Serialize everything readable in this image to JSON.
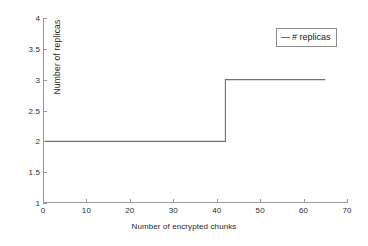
{
  "chart_data": {
    "type": "line",
    "title": "",
    "subtitle": "",
    "xlabel": "Number of encrypted chunks",
    "ylabel": "Number of replicas",
    "xlim": [
      0,
      70
    ],
    "ylim": [
      1,
      4
    ],
    "xticks": [
      0,
      10,
      20,
      30,
      40,
      50,
      60,
      70
    ],
    "xticklabels": [
      "0",
      "10",
      "20",
      "30",
      "40",
      "50",
      "60",
      "70"
    ],
    "yticks": [
      1,
      1.5,
      2,
      2.5,
      3,
      3.5,
      4
    ],
    "yticklabels": [
      "1",
      "1.5",
      "2",
      "2.5",
      "3",
      "3.5",
      "4"
    ],
    "grid": false,
    "legend_position": "top-right",
    "series": [
      {
        "name": "# replicas",
        "color": "#6f6f6f",
        "style": "step",
        "x": [
          0.5,
          42,
          42,
          65
        ],
        "values": [
          2,
          2,
          3,
          3
        ],
        "points": [
          {
            "x": 0.5,
            "y": 2
          },
          {
            "x": 42,
            "y": 2
          },
          {
            "x": 42,
            "y": 3
          },
          {
            "x": 65,
            "y": 3
          }
        ]
      }
    ],
    "annotations": []
  },
  "legend": {
    "entries": [
      {
        "label": "# replicas",
        "marker": "line-marker"
      }
    ]
  },
  "axes": {
    "x_title": "Number of encrypted chunks",
    "y_title": "Number of replicas"
  }
}
